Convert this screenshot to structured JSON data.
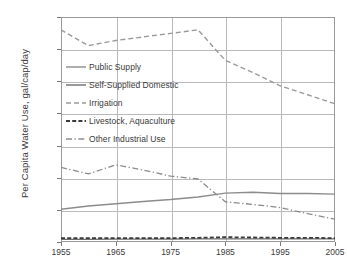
{
  "chart_data": {
    "type": "line",
    "title": "",
    "xlabel": "",
    "ylabel": "Per Capita Water Use, gal/cap/day",
    "xlim": [
      1955,
      2005
    ],
    "ylim": [
      0,
      700
    ],
    "xticks": [
      1955,
      1965,
      1975,
      1985,
      1995,
      2005
    ],
    "yticks": [
      0,
      100,
      200,
      300,
      400,
      500,
      600,
      700
    ],
    "minor_xticks": [
      1960,
      1970,
      1980,
      1990,
      2000
    ],
    "grid": true,
    "legend_position": "upper-left-inside",
    "x": [
      1955,
      1960,
      1965,
      1970,
      1975,
      1980,
      1985,
      1990,
      1995,
      2000,
      2005
    ],
    "series": [
      {
        "name": "Public Supply",
        "style": "solid",
        "color": "#8c8c8c",
        "values": [
          102,
          112,
          119,
          126,
          132,
          140,
          152,
          155,
          151,
          151,
          149
        ]
      },
      {
        "name": "Self-Supplied Domestic",
        "style": "solid",
        "color": "#6e6e6e",
        "values": [
          8,
          8,
          9,
          9,
          9,
          10,
          10,
          10,
          10,
          10,
          10
        ]
      },
      {
        "name": "Irrigation",
        "style": "dashed",
        "color": "#9a9a9a",
        "values": [
          660,
          611,
          627,
          638,
          649,
          660,
          565,
          527,
          486,
          458,
          430
        ]
      },
      {
        "name": "Livestock, Aquaculture",
        "style": "dashed-heavy",
        "color": "#3a3a3a",
        "values": [
          12,
          12,
          12,
          12,
          12,
          13,
          15,
          14,
          13,
          13,
          12
        ]
      },
      {
        "name": "Other Industrial Use",
        "style": "dash-dot",
        "color": "#8c8c8c",
        "values": [
          232,
          212,
          240,
          224,
          205,
          196,
          125,
          117,
          107,
          88,
          71
        ]
      }
    ],
    "ytick_labels": [
      "0",
      "100",
      "200",
      "300",
      "400",
      "500",
      "600",
      "700"
    ],
    "xtick_labels": [
      "1955",
      "1965",
      "1975",
      "1985",
      "1995",
      "2005"
    ]
  },
  "legend": {
    "items": [
      {
        "label": "Public Supply"
      },
      {
        "label": "Self-Supplied Domestic"
      },
      {
        "label": "Irrigation"
      },
      {
        "label": "Livestock, Aquaculture"
      },
      {
        "label": "Other Industrial Use"
      }
    ]
  }
}
